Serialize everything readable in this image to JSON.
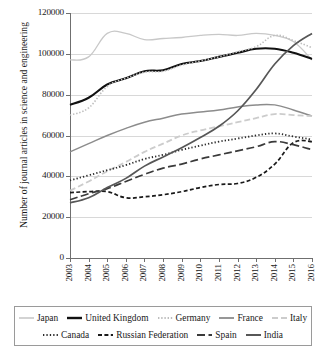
{
  "chart_data": {
    "type": "line",
    "title": "",
    "subtitle": "",
    "xlabel": "",
    "ylabel": "Number of journal articles in science and engineering",
    "categories": [
      "2003",
      "2004",
      "2005",
      "2006",
      "2007",
      "2008",
      "2009",
      "2010",
      "2011",
      "2012",
      "2013",
      "2014",
      "2015",
      "2016"
    ],
    "x": [
      2003,
      2004,
      2005,
      2006,
      2007,
      2008,
      2009,
      2010,
      2011,
      2012,
      2013,
      2014,
      2015,
      2016
    ],
    "ylim": [
      0,
      120000
    ],
    "ytick_labels": [
      "120000",
      "100000",
      "80000",
      "60000",
      "40000",
      "20000",
      "0"
    ],
    "ytick_values": [
      120000,
      100000,
      80000,
      60000,
      40000,
      20000,
      0
    ],
    "grid": "horizontal",
    "legend_position": "bottom",
    "series": [
      {
        "name": "Japan",
        "color": "#c8c8c8",
        "width": 1.3,
        "dash": "none",
        "values": [
          97000,
          98500,
          110000,
          110000,
          107000,
          107500,
          108000,
          109000,
          109500,
          109000,
          110000,
          109000,
          106000,
          97000
        ]
      },
      {
        "name": "United Kingdom",
        "color": "#111111",
        "width": 2.1,
        "dash": "none",
        "values": [
          75000,
          78500,
          85000,
          88000,
          91500,
          92000,
          95000,
          96500,
          98500,
          100500,
          102500,
          102500,
          100500,
          97500
        ]
      },
      {
        "name": "Germany",
        "color": "#bdbdbd",
        "width": 1.6,
        "dash": "1.4,1.8",
        "values": [
          70000,
          73500,
          84000,
          88000,
          91000,
          91500,
          94500,
          96500,
          98500,
          101000,
          103500,
          109000,
          106500,
          103000
        ]
      },
      {
        "name": "France",
        "color": "#8c8c8c",
        "width": 1.5,
        "dash": "none",
        "values": [
          52000,
          56000,
          60000,
          63500,
          66500,
          68500,
          70500,
          71500,
          72500,
          74000,
          75000,
          75000,
          72500,
          69500
        ]
      },
      {
        "name": "Italy",
        "color": "#cccccc",
        "width": 1.8,
        "dash": "6,3",
        "values": [
          33000,
          37500,
          42500,
          47000,
          52000,
          56000,
          60000,
          62500,
          64500,
          66500,
          68500,
          70500,
          70000,
          69500
        ]
      },
      {
        "name": "Canada",
        "color": "#2b2b2b",
        "width": 1.8,
        "dash": "1.3,2.1",
        "values": [
          38000,
          40500,
          43000,
          45500,
          48500,
          50500,
          53000,
          55000,
          57000,
          58500,
          60000,
          61000,
          59500,
          58000
        ]
      },
      {
        "name": "Russian Federation",
        "color": "#1a1a1a",
        "width": 1.7,
        "dash": "4,2.4",
        "values": [
          32000,
          32500,
          32500,
          29500,
          30000,
          31000,
          32500,
          34500,
          36000,
          36500,
          39500,
          46000,
          56500,
          57000
        ]
      },
      {
        "name": "Spain",
        "color": "#3a3a3a",
        "width": 1.7,
        "dash": "8,3.5",
        "values": [
          28500,
          31500,
          34000,
          37500,
          41000,
          44000,
          46000,
          48500,
          50500,
          52500,
          54500,
          57000,
          55500,
          53000
        ]
      },
      {
        "name": "India",
        "color": "#575757",
        "width": 1.7,
        "dash": "none",
        "values": [
          27000,
          29500,
          34500,
          39000,
          45000,
          49500,
          54000,
          59000,
          64500,
          72000,
          82500,
          95000,
          104000,
          110000
        ]
      }
    ]
  },
  "legend": {
    "row1": [
      "Japan",
      "United Kingdom",
      "Germany",
      "France",
      "Italy"
    ],
    "row2": [
      "Canada",
      "Russian Federation",
      "Spain",
      "India"
    ]
  }
}
